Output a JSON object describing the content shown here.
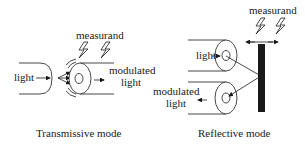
{
  "diagram": {
    "left_panel": {
      "caption": "Transmissive mode",
      "labels": {
        "measurand": "measurand",
        "input": "light",
        "output_line1": "modulated",
        "output_line2": "light"
      },
      "icons": [
        "lightning-icon",
        "lightning-icon",
        "vibration-arcs-icon",
        "fiber-cross-section-icon"
      ]
    },
    "right_panel": {
      "caption": "Reflective mode",
      "labels": {
        "measurand": "measurand",
        "input": "light",
        "output_line1": "modulated",
        "output_line2": "light"
      },
      "icons": [
        "lightning-icon",
        "lightning-icon",
        "double-arrow-icon",
        "reflector-bar",
        "fiber-cross-section-icon",
        "fiber-cross-section-icon"
      ]
    }
  }
}
